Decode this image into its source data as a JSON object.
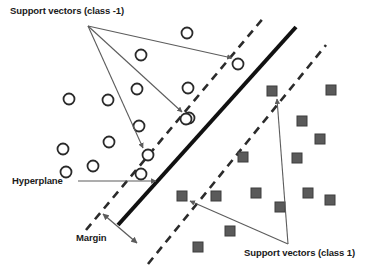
{
  "figure": {
    "background_color": "#ffffff"
  },
  "labels": {
    "support_vectors_negative": "Support vectors (class -1)",
    "support_vectors_positive": "Support vectors (class 1)",
    "hyperplane": "Hyperplane",
    "margin": "Margin"
  },
  "colors": {
    "hyperplane_line": "#111111",
    "margin_line": "#2b2b2b",
    "class_negative_outline": "#2a2a2a",
    "class_negative_fill": "#ffffff",
    "class_positive_fill": "#5a5a5a",
    "class_positive_outline": "#3d3d3d",
    "annotation_arrow": "#5c5c5c",
    "text": "#1a1a1a"
  },
  "chart_data": {
    "type": "scatter",
    "xlabel": "",
    "ylabel": "",
    "xlim": [
      0,
      377
    ],
    "ylim": [
      0,
      270
    ],
    "grid": false,
    "legend_position": "none",
    "series": [
      {
        "name": "class -1",
        "marker": "open-circle",
        "marker_size": 11,
        "fill": "#ffffff",
        "outline": "#2a2a2a",
        "points": [
          {
            "x": 187,
            "y": 33,
            "support_vector": false
          },
          {
            "x": 141,
            "y": 55,
            "support_vector": false
          },
          {
            "x": 238,
            "y": 64,
            "support_vector": true
          },
          {
            "x": 137,
            "y": 89,
            "support_vector": false
          },
          {
            "x": 188,
            "y": 88,
            "support_vector": false
          },
          {
            "x": 69,
            "y": 99,
            "support_vector": false
          },
          {
            "x": 108,
            "y": 100,
            "support_vector": false
          },
          {
            "x": 189,
            "y": 118,
            "support_vector": false
          },
          {
            "x": 186,
            "y": 119,
            "support_vector": false
          },
          {
            "x": 148,
            "y": 155,
            "support_vector": true
          },
          {
            "x": 109,
            "y": 142,
            "support_vector": false
          },
          {
            "x": 63,
            "y": 149,
            "support_vector": false
          },
          {
            "x": 93,
            "y": 166,
            "support_vector": false
          },
          {
            "x": 66,
            "y": 172,
            "support_vector": false
          },
          {
            "x": 139,
            "y": 126,
            "support_vector": false
          },
          {
            "x": 141,
            "y": 174,
            "support_vector": false
          }
        ]
      },
      {
        "name": "class 1",
        "marker": "filled-square",
        "marker_size": 10,
        "fill": "#5a5a5a",
        "outline": "#3d3d3d",
        "points": [
          {
            "x": 272,
            "y": 91,
            "support_vector": true
          },
          {
            "x": 331,
            "y": 90,
            "support_vector": false
          },
          {
            "x": 302,
            "y": 121,
            "support_vector": false
          },
          {
            "x": 320,
            "y": 139,
            "support_vector": false
          },
          {
            "x": 243,
            "y": 157,
            "support_vector": false
          },
          {
            "x": 297,
            "y": 158,
            "support_vector": false
          },
          {
            "x": 182,
            "y": 196,
            "support_vector": true
          },
          {
            "x": 216,
            "y": 196,
            "support_vector": false
          },
          {
            "x": 256,
            "y": 193,
            "support_vector": false
          },
          {
            "x": 308,
            "y": 193,
            "support_vector": false
          },
          {
            "x": 330,
            "y": 200,
            "support_vector": false
          },
          {
            "x": 280,
            "y": 207,
            "support_vector": false
          },
          {
            "x": 230,
            "y": 231,
            "support_vector": false
          },
          {
            "x": 198,
            "y": 247,
            "support_vector": false
          }
        ]
      }
    ],
    "lines": [
      {
        "name": "hyperplane",
        "style": "solid",
        "width": 4,
        "x1": 118,
        "y1": 225,
        "x2": 296,
        "y2": 27
      },
      {
        "name": "margin-boundary-negative",
        "style": "dashed",
        "width": 2.6,
        "x1": 86,
        "y1": 230,
        "x2": 265,
        "y2": 16
      },
      {
        "name": "margin-boundary-positive",
        "style": "dashed",
        "width": 2.6,
        "x1": 148,
        "y1": 264,
        "x2": 326,
        "y2": 45
      }
    ],
    "annotations": [
      {
        "text": "Support vectors (class -1)",
        "anchor_x": 10,
        "anchor_y": 14
      },
      {
        "text": "Support vectors (class 1)",
        "anchor_x": 244,
        "anchor_y": 256
      },
      {
        "text": "Hyperplane",
        "anchor_x": 12,
        "anchor_y": 183
      },
      {
        "text": "Margin",
        "anchor_x": 76,
        "anchor_y": 240
      }
    ]
  }
}
